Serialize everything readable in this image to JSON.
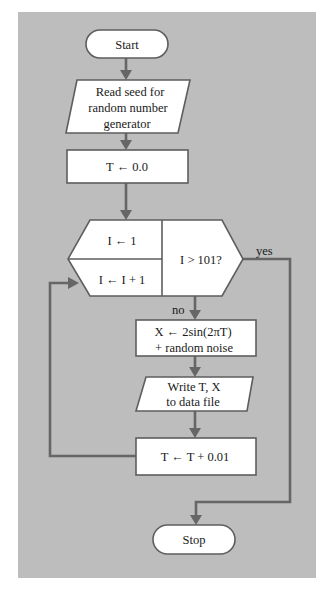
{
  "diagram": {
    "type": "flowchart",
    "background_color": "#bdbdbd",
    "nodes": {
      "start": {
        "kind": "terminator",
        "label": "Start"
      },
      "read_seed": {
        "kind": "io",
        "lines": [
          "Read seed for",
          "random number",
          "generator"
        ]
      },
      "init_t": {
        "kind": "process",
        "label": "T ← 0.0"
      },
      "loop": {
        "kind": "loop-hexagon",
        "init": "I ← 1",
        "increment": "I ← I + 1",
        "condition": "I > 101?"
      },
      "compute_x": {
        "kind": "process",
        "lines": [
          "X ← 2sin(2πT)",
          "+ random noise"
        ]
      },
      "write": {
        "kind": "io",
        "lines": [
          "Write T, X",
          "to data file"
        ]
      },
      "increment_t": {
        "kind": "process",
        "label": "T ← T + 0.01"
      },
      "stop": {
        "kind": "terminator",
        "label": "Stop"
      }
    },
    "edge_labels": {
      "yes": "yes",
      "no": "no"
    }
  }
}
